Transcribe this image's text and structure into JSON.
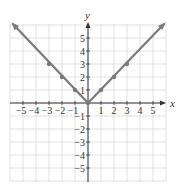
{
  "chart_data": {
    "type": "line",
    "title": "",
    "function": "y = |x|",
    "xlabel": "x",
    "ylabel": "y",
    "xlim": [
      -6,
      6
    ],
    "ylim": [
      -6,
      6
    ],
    "grid": true,
    "x_ticks": [
      -5,
      -4,
      -3,
      -2,
      -1,
      1,
      2,
      3,
      4,
      5
    ],
    "y_ticks": [
      -5,
      -4,
      -3,
      -2,
      -1,
      1,
      2,
      3,
      4,
      5
    ],
    "x_tick_labels": [
      "−5",
      "−4",
      "−3",
      "−2",
      "−1",
      "1",
      "2",
      "3",
      "4",
      "5"
    ],
    "y_tick_labels": [
      "5",
      "4",
      "3",
      "2",
      "1",
      "−1",
      "−2",
      "−3",
      "−4",
      "−5"
    ],
    "series": [
      {
        "name": "y = |x|",
        "x": [
          -3,
          -2,
          -1,
          0,
          1,
          2,
          3
        ],
        "y": [
          3,
          2,
          1,
          0,
          1,
          2,
          3
        ],
        "marked_points": [
          [
            -3,
            3
          ],
          [
            -2,
            2
          ],
          [
            -1,
            1
          ],
          [
            0,
            0
          ],
          [
            1,
            1
          ],
          [
            2,
            2
          ],
          [
            3,
            3
          ]
        ],
        "arrows_at_ends": true,
        "color": "#7a7a7a"
      }
    ]
  },
  "colors": {
    "grid": "#d9d9d9",
    "axis": "#333333",
    "curve": "#7a7a7a"
  }
}
